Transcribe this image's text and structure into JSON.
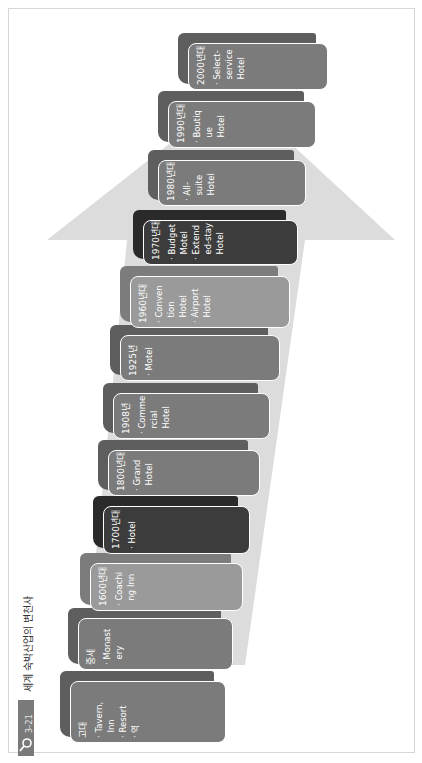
{
  "figure": {
    "label": "그림 3-21",
    "title": "세계 숙박산업의 변천사",
    "icon": "magnifier-icon"
  },
  "colors": {
    "arrow": "#dcdcdc",
    "card_mid": "#7b7b7b",
    "card_light": "#9a9a9a",
    "card_dark": "#3c3c3c",
    "card_back_mid": "#5e5e5e",
    "card_back_light": "#7c7c7c",
    "card_back_dark": "#2a2a2a",
    "border": "#ffffff"
  },
  "timeline": [
    {
      "era": "고대",
      "items": [
        "· Tavern,",
        "  Inn",
        "· Resort",
        "· 역"
      ],
      "tone": "mid"
    },
    {
      "era": "중세",
      "items": [
        "· Monast",
        "  ery"
      ],
      "tone": "mid"
    },
    {
      "era": "1600년대",
      "items": [
        "· Coachi",
        "  ng Inn"
      ],
      "tone": "light"
    },
    {
      "era": "1700년대",
      "items": [
        "· Hotel"
      ],
      "tone": "dark"
    },
    {
      "era": "1800년대",
      "items": [
        "· Grand",
        "  Hotel"
      ],
      "tone": "mid"
    },
    {
      "era": "1908년",
      "items": [
        "· Comme",
        "  rcial",
        "  Hotel"
      ],
      "tone": "mid"
    },
    {
      "era": "1925년",
      "items": [
        "· Motel"
      ],
      "tone": "mid"
    },
    {
      "era": "1960년대",
      "items": [
        "· Conven",
        "  tion",
        "  Hotel",
        "· Airport",
        "  Hotel"
      ],
      "tone": "light"
    },
    {
      "era": "1970년대",
      "items": [
        "· Budget",
        "  Motel",
        "· Extend",
        "  ed-stay",
        "  Hotel"
      ],
      "tone": "dark"
    },
    {
      "era": "1980년대",
      "items": [
        "· All-",
        "  suite",
        "  Hotel"
      ],
      "tone": "mid"
    },
    {
      "era": "1990년대",
      "items": [
        "· Boutiq",
        "  ue",
        "  Hotel"
      ],
      "tone": "mid"
    },
    {
      "era": "2000년대",
      "items": [
        "· Select-",
        "  service",
        "  Hotel"
      ],
      "tone": "mid"
    }
  ]
}
